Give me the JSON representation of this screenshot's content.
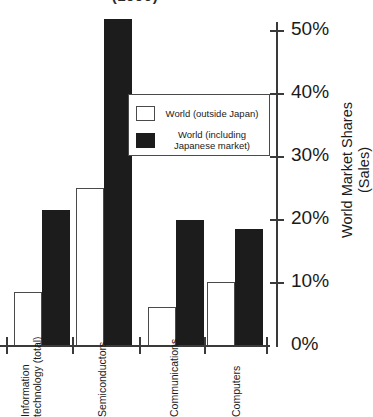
{
  "chart_data": {
    "type": "bar",
    "title": "(1990)",
    "xlabel": "",
    "ylabel": "World Market Shares (Sales)",
    "ylabel_line1": "World Market Shares",
    "ylabel_line2": "(Sales)",
    "ylim": [
      0,
      50
    ],
    "yunit": "%",
    "grid": false,
    "legend_position": "upper center inside plot",
    "categories": [
      "Information technology (total)",
      "Semiconductors",
      "Communications",
      "Computers"
    ],
    "category_lines": [
      [
        "Information",
        "technology (total)"
      ],
      [
        "Semiconductors",
        ""
      ],
      [
        "Communications",
        ""
      ],
      [
        "Computers",
        ""
      ]
    ],
    "series": [
      {
        "name": "World (outside Japan)",
        "color": "#ffffff",
        "values": [
          8.5,
          25.0,
          6.0,
          10.0
        ]
      },
      {
        "name": "World (including Japanese market)",
        "color": "#1c1c1c",
        "values": [
          21.5,
          50.0,
          20.0,
          18.5
        ]
      }
    ],
    "yticks": [
      {
        "value": 50,
        "label": "50%"
      },
      {
        "value": 40,
        "label": "40%"
      },
      {
        "value": 30,
        "label": "30%"
      },
      {
        "value": 20,
        "label": "20%"
      },
      {
        "value": 10,
        "label": "10%"
      },
      {
        "value": 0,
        "label": "0%"
      }
    ]
  },
  "legend": {
    "entries": [
      {
        "label": "World (outside Japan)",
        "swatch": "light-square-swatch"
      },
      {
        "label": "World (including Japanese market)",
        "swatch": "dark-square-swatch"
      }
    ],
    "entry_0_label": "World (outside Japan)",
    "entry_1_line1": "World (including Japanese",
    "entry_1_line2": "market)"
  },
  "axis": {
    "y_tick_50": "50%",
    "y_tick_40": "40%",
    "y_tick_30": "30%",
    "y_tick_20": "20%",
    "y_tick_10": "10%",
    "y_tick_0": "0%",
    "y_title_line1": "World Market Shares",
    "y_title_line2": "(Sales)",
    "x_label_0_line1": "Information",
    "x_label_0_line2": "technology (total)",
    "x_label_1": "Semiconductors",
    "x_label_2": "Communications",
    "x_label_3": "Computers"
  },
  "colors": {
    "series_light": "#ffffff",
    "series_dark": "#1c1c1c",
    "axis": "#3a3a3a",
    "text": "#1a1a1a",
    "background": "#ffffff"
  }
}
